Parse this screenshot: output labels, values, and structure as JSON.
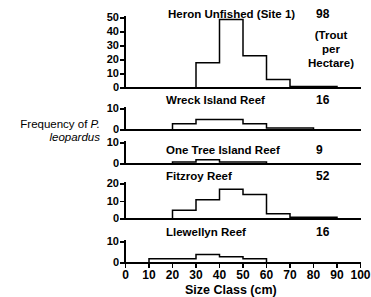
{
  "figure": {
    "y_axis_label_line1": "Frequency of ",
    "y_axis_label_species": "P.",
    "y_axis_label_line2": "leopardus",
    "x_axis_title": "Size Class (cm)",
    "density_note": "(Trout\nper\nHectare)",
    "density_note_lines": [
      "(Trout",
      "per",
      "Hectare)"
    ]
  },
  "chart_data": {
    "type": "bar",
    "xlabel": "Size Class (cm)",
    "ylabel": "Frequency of P. leopardus",
    "xlim": [
      0,
      100
    ],
    "xticks": [
      0,
      10,
      20,
      30,
      40,
      50,
      60,
      70,
      80,
      90,
      100
    ],
    "xtick_labels": [
      "0",
      "10",
      "20",
      "30",
      "40",
      "50",
      "60",
      "70",
      "80",
      "90",
      "100"
    ],
    "bin_width": 10,
    "bin_edges": [
      0,
      10,
      20,
      30,
      40,
      50,
      60,
      70,
      80,
      90,
      100
    ],
    "grid": false,
    "legend": "none",
    "panels": [
      {
        "name": "Heron Unfished (Site 1)",
        "density": "98",
        "density_units": "(Trout per Hectare)",
        "ylim": [
          0,
          50
        ],
        "yticks": [
          0,
          10,
          20,
          30,
          40,
          50
        ],
        "ytick_labels": [
          "0",
          "10",
          "20",
          "30",
          "40",
          "50"
        ],
        "categories": [
          "0-10",
          "10-20",
          "20-30",
          "30-40",
          "40-50",
          "50-60",
          "60-70",
          "70-80",
          "80-90",
          "90-100"
        ],
        "values": [
          0,
          0,
          0,
          18,
          49,
          23,
          6,
          1,
          1,
          0
        ]
      },
      {
        "name": "Wreck Island Reef",
        "density": "16",
        "ylim": [
          0,
          10
        ],
        "yticks": [
          0,
          10
        ],
        "ytick_labels": [
          "0",
          "10"
        ],
        "categories": [
          "0-10",
          "10-20",
          "20-30",
          "30-40",
          "40-50",
          "50-60",
          "60-70",
          "70-80",
          "80-90",
          "90-100"
        ],
        "values": [
          0,
          0,
          3,
          5,
          5,
          3,
          1,
          1,
          0,
          0
        ]
      },
      {
        "name": "One Tree Island Reef",
        "density": "9",
        "ylim": [
          0,
          10
        ],
        "yticks": [
          0,
          10
        ],
        "ytick_labels": [
          "0",
          "10"
        ],
        "categories": [
          "0-10",
          "10-20",
          "20-30",
          "30-40",
          "40-50",
          "50-60",
          "60-70",
          "70-80",
          "80-90",
          "90-100"
        ],
        "values": [
          0,
          0,
          1,
          2,
          1,
          1,
          0,
          0,
          0,
          0
        ]
      },
      {
        "name": "Fitzroy Reef",
        "density": "52",
        "ylim": [
          0,
          20
        ],
        "yticks": [
          0,
          10,
          20
        ],
        "ytick_labels": [
          "0",
          "10",
          "20"
        ],
        "categories": [
          "0-10",
          "10-20",
          "20-30",
          "30-40",
          "40-50",
          "50-60",
          "60-70",
          "70-80",
          "80-90",
          "90-100"
        ],
        "values": [
          0,
          0,
          5,
          11,
          17,
          14,
          3,
          1,
          1,
          0
        ]
      },
      {
        "name": "Llewellyn Reef",
        "density": "16",
        "ylim": [
          0,
          10
        ],
        "yticks": [
          0,
          10
        ],
        "ytick_labels": [
          "0",
          "10"
        ],
        "categories": [
          "0-10",
          "10-20",
          "20-30",
          "30-40",
          "40-50",
          "50-60",
          "60-70",
          "70-80",
          "80-90",
          "90-100"
        ],
        "values": [
          0,
          2,
          2,
          4,
          3,
          2,
          0,
          0,
          0,
          0
        ]
      }
    ]
  }
}
